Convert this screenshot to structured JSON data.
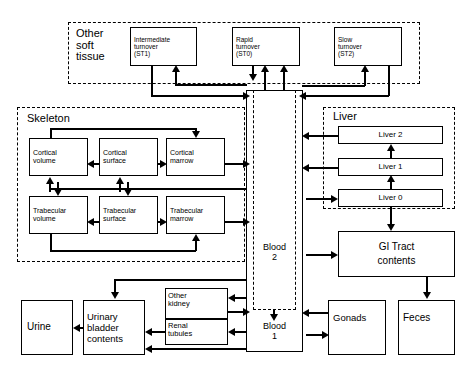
{
  "diagram": {
    "type": "compartment-flow-diagram",
    "background_color": "#ffffff",
    "line_color": "#000000"
  },
  "groups": [
    {
      "id": "other-soft-tissue",
      "title": "Other\nsoft\ntissue",
      "x": 68,
      "y": 22,
      "w": 352,
      "h": 62
    },
    {
      "id": "skeleton",
      "title": "Skeleton",
      "x": 17,
      "y": 107,
      "w": 228,
      "h": 155
    },
    {
      "id": "liver",
      "title": "Liver",
      "x": 323,
      "y": 107,
      "w": 132,
      "h": 102
    }
  ],
  "nodes": [
    {
      "id": "st1",
      "label": "Intermediate\nturnover\n(ST1)",
      "x": 130,
      "y": 27,
      "w": 67,
      "h": 39,
      "align": "left",
      "size": 6.5
    },
    {
      "id": "st0",
      "label": "Rapid\nturnover\n(ST0)",
      "x": 232,
      "y": 27,
      "w": 68,
      "h": 39,
      "align": "left",
      "size": 6.5
    },
    {
      "id": "st2",
      "label": "Slow\nturnover\n(ST2)",
      "x": 334,
      "y": 27,
      "w": 68,
      "h": 39,
      "align": "left",
      "size": 6.5
    },
    {
      "id": "cortical-volume",
      "label": "Cortical\nvolume",
      "x": 29,
      "y": 138,
      "w": 59,
      "h": 38,
      "align": "left",
      "size": 7
    },
    {
      "id": "cortical-surface",
      "label": "Cortical\nsurface",
      "x": 99,
      "y": 138,
      "w": 59,
      "h": 38,
      "align": "left",
      "size": 7
    },
    {
      "id": "cortical-marrow",
      "label": "Cortical\nmarrow",
      "x": 166,
      "y": 138,
      "w": 59,
      "h": 38,
      "align": "left",
      "size": 7
    },
    {
      "id": "trabecular-volume",
      "label": "Trabecular\nvolume",
      "x": 29,
      "y": 196,
      "w": 59,
      "h": 38,
      "align": "left",
      "size": 7
    },
    {
      "id": "trabecular-surface",
      "label": "Trabecular\nsurface",
      "x": 99,
      "y": 196,
      "w": 59,
      "h": 38,
      "align": "left",
      "size": 7
    },
    {
      "id": "trabecular-marrow",
      "label": "Trabecular\nmarrow",
      "x": 166,
      "y": 196,
      "w": 59,
      "h": 38,
      "align": "left",
      "size": 7
    },
    {
      "id": "liver-2",
      "label": "Liver 2",
      "x": 338,
      "y": 126,
      "w": 105,
      "h": 18,
      "align": "center",
      "size": 8
    },
    {
      "id": "liver-1",
      "label": "Liver 1",
      "x": 338,
      "y": 158,
      "w": 105,
      "h": 18,
      "align": "center",
      "size": 8
    },
    {
      "id": "liver-0",
      "label": "Liver 0",
      "x": 338,
      "y": 189,
      "w": 105,
      "h": 18,
      "align": "center",
      "size": 8
    },
    {
      "id": "gi-tract",
      "label": "GI Tract\ncontents",
      "x": 338,
      "y": 231,
      "w": 117,
      "h": 46,
      "align": "center",
      "size": 10
    },
    {
      "id": "urine",
      "label": "Urine",
      "x": 21,
      "y": 300,
      "w": 52,
      "h": 55,
      "align": "left",
      "size": 10
    },
    {
      "id": "urinary-bladder",
      "label": "Urinary\nbladder\ncontents",
      "x": 83,
      "y": 300,
      "w": 62,
      "h": 55,
      "align": "left",
      "size": 9.5
    },
    {
      "id": "kidney",
      "label": "",
      "x": 165,
      "y": 288,
      "w": 63,
      "h": 57,
      "align": "left",
      "size": 7.5
    },
    {
      "id": "gonads",
      "label": "Gonads",
      "x": 328,
      "y": 300,
      "w": 58,
      "h": 55,
      "align": "left",
      "size": 9.5
    },
    {
      "id": "feces",
      "label": "Feces",
      "x": 398,
      "y": 300,
      "w": 57,
      "h": 55,
      "align": "left",
      "size": 10
    }
  ],
  "kidney_subnodes": [
    {
      "id": "other-kidney",
      "label": "Other\nkidney",
      "x": 165,
      "y": 288,
      "w": 63,
      "h": 30
    },
    {
      "id": "renal-tubules",
      "label": "Renal\ntubules",
      "x": 165,
      "y": 318,
      "w": 63,
      "h": 27
    }
  ],
  "blood": {
    "outer": {
      "x": 246,
      "y": 90,
      "w": 57,
      "h": 262
    },
    "inner": {
      "x": 253,
      "y": 90,
      "w": 43,
      "h": 220
    },
    "labels": [
      {
        "id": "blood-2",
        "text": "Blood\n2",
        "x": 253,
        "y": 243,
        "w": 43
      },
      {
        "id": "blood-1",
        "text": "Blood\n1",
        "x": 253,
        "y": 322,
        "w": 43
      }
    ]
  },
  "connections": [
    {
      "from": "blood",
      "to": "st1",
      "label": ""
    },
    {
      "from": "st1",
      "to": "blood",
      "label": ""
    },
    {
      "from": "blood",
      "to": "st0",
      "label": ""
    },
    {
      "from": "st0",
      "to": "blood",
      "label": ""
    },
    {
      "from": "blood",
      "to": "st2",
      "label": ""
    },
    {
      "from": "st2",
      "to": "blood",
      "label": ""
    },
    {
      "from": "cortical-surface",
      "to": "cortical-volume",
      "label": ""
    },
    {
      "from": "cortical-surface",
      "to": "cortical-marrow",
      "label": ""
    },
    {
      "from": "cortical-volume",
      "to": "cortical-marrow",
      "label": ""
    },
    {
      "from": "cortical-marrow",
      "to": "blood",
      "label": ""
    },
    {
      "from": "blood",
      "to": "cortical-surface",
      "label": ""
    },
    {
      "from": "blood",
      "to": "cortical-volume",
      "label": ""
    },
    {
      "from": "trabecular-surface",
      "to": "trabecular-volume",
      "label": ""
    },
    {
      "from": "trabecular-surface",
      "to": "trabecular-marrow",
      "label": ""
    },
    {
      "from": "trabecular-volume",
      "to": "trabecular-marrow",
      "label": ""
    },
    {
      "from": "trabecular-marrow",
      "to": "blood",
      "label": ""
    },
    {
      "from": "blood",
      "to": "trabecular-surface",
      "label": ""
    },
    {
      "from": "liver-1",
      "to": "liver-2",
      "label": ""
    },
    {
      "from": "liver-0",
      "to": "liver-1",
      "label": ""
    },
    {
      "from": "liver-2",
      "to": "blood",
      "label": ""
    },
    {
      "from": "liver-1",
      "to": "blood",
      "label": ""
    },
    {
      "from": "blood",
      "to": "liver-0",
      "label": ""
    },
    {
      "from": "liver-0",
      "to": "gi-tract",
      "label": ""
    },
    {
      "from": "blood",
      "to": "gi-tract",
      "label": ""
    },
    {
      "from": "gi-tract",
      "to": "feces",
      "label": ""
    },
    {
      "from": "blood",
      "to": "gonads",
      "label": ""
    },
    {
      "from": "gonads",
      "to": "blood",
      "label": ""
    },
    {
      "from": "blood",
      "to": "other-kidney",
      "label": ""
    },
    {
      "from": "other-kidney",
      "to": "blood",
      "label": ""
    },
    {
      "from": "blood",
      "to": "renal-tubules",
      "label": ""
    },
    {
      "from": "renal-tubules",
      "to": "urinary-bladder",
      "label": ""
    },
    {
      "from": "blood",
      "to": "urinary-bladder",
      "label": ""
    },
    {
      "from": "other-kidney",
      "to": "urinary-bladder",
      "label": ""
    },
    {
      "from": "urinary-bladder",
      "to": "urine",
      "label": ""
    }
  ]
}
